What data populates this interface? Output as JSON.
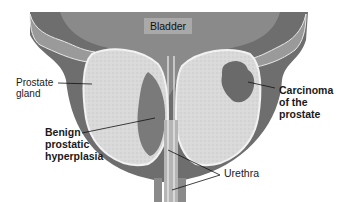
{
  "diagram": {
    "labels": {
      "bladder": "Bladder",
      "prostate_gland": [
        "Prostate",
        "gland"
      ],
      "bph": [
        "Benign",
        "prostatic",
        "hyperplasia"
      ],
      "carcinoma": [
        "Carcinoma",
        "of the",
        "prostate"
      ],
      "urethra": "Urethra"
    },
    "colors": {
      "bladder_wall": "#6e6e6e",
      "bladder_lumen": "#8a8a8a",
      "outer_capsule": "#5f5f5f",
      "gland_tissue": "#d8d8d8",
      "hyperplasia": "#7a7a7a",
      "carcinoma": "#6a6a6a",
      "urethra": "#b5b5b5",
      "background": "#ffffff"
    }
  }
}
